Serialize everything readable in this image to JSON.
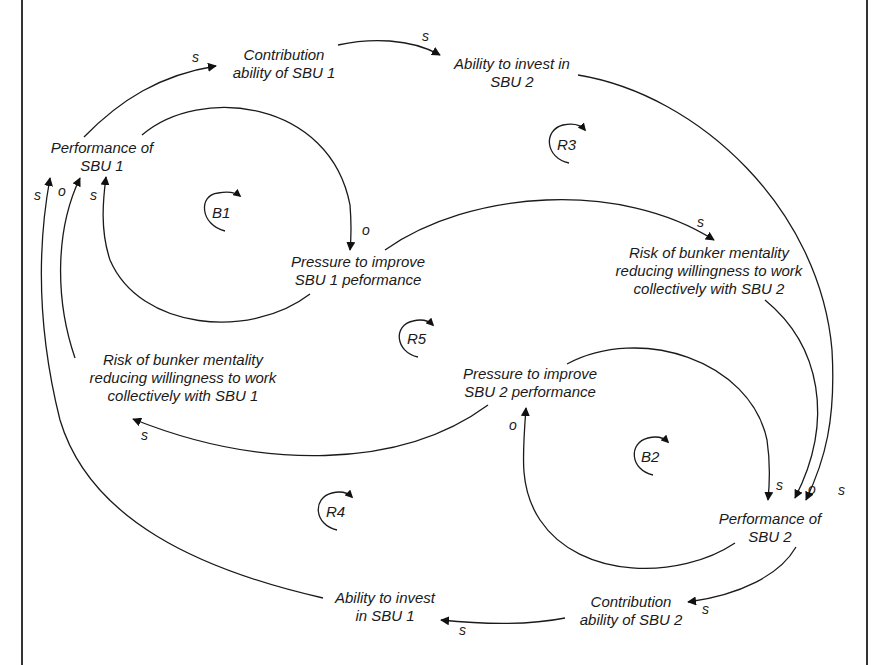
{
  "diagram": {
    "type": "causal-loop-diagram",
    "nodes": {
      "perf1": [
        "Performance of",
        "SBU 1"
      ],
      "contrib1": [
        "Contribution",
        "ability of SBU 1"
      ],
      "invest2": [
        "Ability to invest in",
        "SBU 2"
      ],
      "pressure1": [
        "Pressure to improve",
        "SBU 1 peformance"
      ],
      "bunker2": [
        "Risk of bunker mentality",
        "reducing willingness to work",
        "collectively with SBU 2"
      ],
      "bunker1": [
        "Risk of bunker mentality",
        "reducing willingness to work",
        "collectively with SBU 1"
      ],
      "pressure2": [
        "Pressure to improve",
        "SBU 2 performance"
      ],
      "perf2": [
        "Performance of",
        "SBU 2"
      ],
      "contrib2": [
        "Contribution",
        "ability of SBU 2"
      ],
      "invest1": [
        "Ability to invest",
        "in SBU 1"
      ]
    },
    "loops": {
      "b1": "B1",
      "b2": "B2",
      "r3": "R3",
      "r4": "R4",
      "r5": "R5"
    },
    "links": [
      {
        "from": "perf1",
        "to": "contrib1",
        "polarity": "s"
      },
      {
        "from": "contrib1",
        "to": "invest2",
        "polarity": "s"
      },
      {
        "from": "invest2",
        "to": "perf2",
        "polarity": "s"
      },
      {
        "from": "perf1",
        "to": "pressure1",
        "polarity": "o"
      },
      {
        "from": "pressure1",
        "to": "perf1",
        "polarity": "s"
      },
      {
        "from": "pressure1",
        "to": "bunker2",
        "polarity": "s"
      },
      {
        "from": "bunker2",
        "to": "perf2",
        "polarity": "o"
      },
      {
        "from": "pressure2",
        "to": "bunker1",
        "polarity": "s"
      },
      {
        "from": "bunker1",
        "to": "perf1",
        "polarity": "o"
      },
      {
        "from": "perf2",
        "to": "pressure2",
        "polarity": "o"
      },
      {
        "from": "pressure2",
        "to": "perf2",
        "polarity": "s"
      },
      {
        "from": "perf2",
        "to": "contrib2",
        "polarity": "s"
      },
      {
        "from": "contrib2",
        "to": "invest1",
        "polarity": "s"
      },
      {
        "from": "invest1",
        "to": "perf1",
        "polarity": "s"
      }
    ],
    "polarity_labels": {
      "p1": "s",
      "p2": "s",
      "p3": "o",
      "p4": "s",
      "p5": "o",
      "p6": "s",
      "p7": "s",
      "p8": "o",
      "p9": "s",
      "p10": "o",
      "p11": "s",
      "p12": "s",
      "p13": "s",
      "p14": "s"
    }
  }
}
